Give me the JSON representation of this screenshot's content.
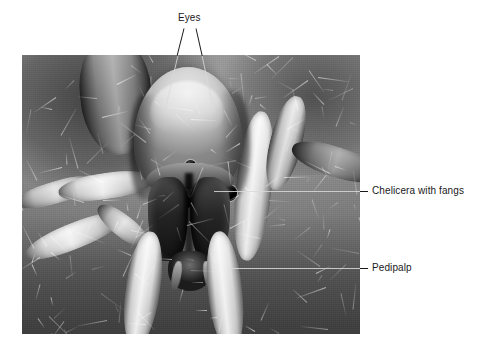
{
  "figure": {
    "kind": "labeled scanning-electron-micrograph",
    "background_color": "#ffffff",
    "label_color": "#1a1a1a",
    "plate": {
      "x": 22,
      "y": 55,
      "width": 338,
      "height": 279,
      "base_color": "#8a8a8a",
      "floor_color": "#5c5c5c"
    }
  },
  "labels": [
    {
      "id": "eyes",
      "text": "Eyes",
      "text_x": 178,
      "text_y": 12,
      "leaders": [
        {
          "x1": 184,
          "y1": 28,
          "x2": 164,
          "y2": 112
        },
        {
          "x1": 196,
          "y1": 28,
          "x2": 214,
          "y2": 112
        }
      ]
    },
    {
      "id": "chelicera",
      "text": "Chelicera with fangs",
      "text_x": 372,
      "text_y": 185,
      "leaders": [
        {
          "x1": 214,
          "y1": 191,
          "x2": 368,
          "y2": 191
        }
      ]
    },
    {
      "id": "pedipalp",
      "text": "Pedipalp",
      "text_x": 372,
      "text_y": 262,
      "leaders": [
        {
          "x1": 232,
          "y1": 268,
          "x2": 368,
          "y2": 268
        }
      ]
    }
  ],
  "specimen": {
    "eyes": {
      "count": 8,
      "color": "#000000",
      "positions": [
        {
          "cx": 151,
          "cy": 118,
          "r": 7.5
        },
        {
          "cx": 178,
          "cy": 116,
          "r": 7.5
        },
        {
          "cx": 138,
          "cy": 143,
          "r": 8.5
        },
        {
          "cx": 160,
          "cy": 147,
          "r": 8.5
        },
        {
          "cx": 187,
          "cy": 145,
          "r": 8.0
        },
        {
          "cx": 207,
          "cy": 138,
          "r": 8.0
        },
        {
          "cx": 197,
          "cy": 122,
          "r": 6.5
        },
        {
          "cx": 168,
          "cy": 110,
          "r": 5.5
        }
      ]
    },
    "appendages": [
      {
        "name": "leg-left-outer",
        "x": 0,
        "y": 168,
        "w": 104,
        "h": 26,
        "rot": -22,
        "tone": "light"
      },
      {
        "name": "leg-left-outer-2",
        "x": -8,
        "y": 126,
        "w": 86,
        "h": 22,
        "rot": -16,
        "tone": "normal"
      },
      {
        "name": "leg-left-mid",
        "x": 36,
        "y": 118,
        "w": 96,
        "h": 26,
        "rot": -8,
        "tone": "light"
      },
      {
        "name": "leg-left-inner",
        "x": 70,
        "y": 160,
        "w": 62,
        "h": 22,
        "rot": 38,
        "tone": "normal"
      },
      {
        "name": "pedipalp-left",
        "x": 104,
        "y": 176,
        "w": 34,
        "h": 116,
        "rot": 8,
        "tone": "light"
      },
      {
        "name": "pedipalp-right",
        "x": 186,
        "y": 176,
        "w": 34,
        "h": 120,
        "rot": -6,
        "tone": "light"
      },
      {
        "name": "leg-right-inner",
        "x": 214,
        "y": 56,
        "w": 36,
        "h": 150,
        "rot": 6,
        "tone": "light"
      },
      {
        "name": "leg-right-mid",
        "x": 248,
        "y": 40,
        "w": 32,
        "h": 96,
        "rot": 14,
        "tone": "normal"
      },
      {
        "name": "leg-right-outer",
        "x": 268,
        "y": 92,
        "w": 92,
        "h": 30,
        "rot": 18,
        "tone": "dark"
      },
      {
        "name": "body-upper-left",
        "x": 58,
        "y": -20,
        "w": 72,
        "h": 120,
        "rot": -6,
        "tone": "dark"
      }
    ]
  }
}
